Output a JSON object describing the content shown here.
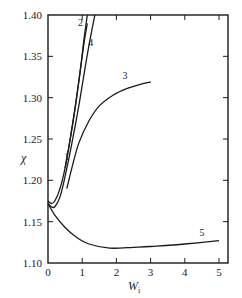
{
  "chart_data": {
    "type": "line",
    "title": "",
    "xlabel": "W_i",
    "ylabel": "χ",
    "xlim": [
      0,
      5.25
    ],
    "ylim": [
      1.1,
      1.4
    ],
    "xticks": [
      0,
      1,
      2,
      3,
      4,
      5
    ],
    "yticks": [
      1.1,
      1.15,
      1.2,
      1.25,
      1.3,
      1.35,
      1.4
    ],
    "ytick_labels": [
      "1.10",
      "1.15",
      "1.20",
      "1.25",
      "1.30",
      "1.35",
      "1.40"
    ],
    "grid": false,
    "legend": "none (curves labeled inline 1–5)",
    "series": [
      {
        "name": "1",
        "x": [
          0,
          0.1,
          0.2,
          0.35,
          0.5,
          0.65,
          0.8,
          0.95,
          1.05,
          1.15
        ],
        "y": [
          1.175,
          1.172,
          1.175,
          1.19,
          1.215,
          1.25,
          1.29,
          1.335,
          1.37,
          1.4
        ]
      },
      {
        "name": "2",
        "x": [
          0.5,
          0.65,
          0.8,
          0.95,
          1.05,
          1.15
        ],
        "y": [
          1.215,
          1.25,
          1.29,
          1.335,
          1.365,
          1.39
        ]
      },
      {
        "name": "4",
        "x": [
          0,
          0.1,
          0.2,
          0.35,
          0.5,
          0.7,
          0.9,
          1.1,
          1.25,
          1.37
        ],
        "y": [
          1.172,
          1.168,
          1.168,
          1.18,
          1.205,
          1.245,
          1.29,
          1.34,
          1.375,
          1.4
        ]
      },
      {
        "name": "3",
        "x": [
          0.55,
          0.7,
          0.9,
          1.2,
          1.5,
          1.9,
          2.3,
          2.7,
          3.0
        ],
        "y": [
          1.19,
          1.215,
          1.245,
          1.272,
          1.29,
          1.303,
          1.311,
          1.316,
          1.319
        ]
      },
      {
        "name": "5",
        "x": [
          0,
          0.2,
          0.5,
          0.8,
          1.2,
          1.8,
          2.5,
          3.0,
          4.0,
          5.0
        ],
        "y": [
          1.172,
          1.158,
          1.143,
          1.132,
          1.123,
          1.118,
          1.119,
          1.12,
          1.123,
          1.127
        ]
      }
    ],
    "annotations": [
      {
        "text": "1",
        "x": 0.55,
        "y": 1.225
      },
      {
        "text": "2",
        "x": 0.95,
        "y": 1.387
      },
      {
        "text": "4",
        "x": 1.25,
        "y": 1.363
      },
      {
        "text": "3",
        "x": 2.25,
        "y": 1.322
      },
      {
        "text": "5",
        "x": 4.5,
        "y": 1.133
      }
    ]
  },
  "labels": {
    "x_axis_title": "W",
    "x_axis_subscript": "i",
    "y_axis_title": "χ",
    "x_tick_labels": [
      "0",
      "1",
      "2",
      "3",
      "4",
      "5"
    ],
    "y_tick_labels": [
      "1.10",
      "1.15",
      "1.20",
      "1.25",
      "1.30",
      "1.35",
      "1.40"
    ],
    "curve_labels": [
      "1",
      "2",
      "3",
      "4",
      "5"
    ]
  },
  "colors": {
    "line": "#1a1a1a",
    "background": "#ffffff"
  }
}
